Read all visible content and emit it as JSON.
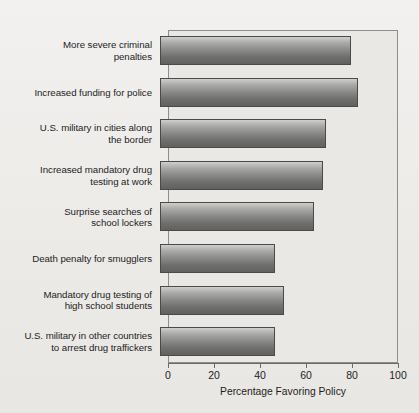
{
  "chart_data": {
    "type": "bar",
    "orientation": "horizontal",
    "title": "",
    "xlabel": "Percentage Favoring Policy",
    "ylabel": "",
    "xlim": [
      0,
      100
    ],
    "xticks": [
      0,
      20,
      40,
      60,
      80,
      100
    ],
    "xtick_labels": [
      "0",
      "20",
      "40",
      "60",
      "80",
      "100"
    ],
    "grid": false,
    "legend": "none",
    "categories": [
      "More severe criminal\npenalties",
      "Increased funding for police",
      "U.S. military in cities along\nthe border",
      "Increased mandatory drug\ntesting at work",
      "Surprise searches of\nschool lockers",
      "Death penalty for smugglers",
      "Mandatory drug testing of\nhigh school students",
      "U.S. military in other countries\nto arrest drug traffickers"
    ],
    "values": [
      83,
      86,
      72,
      71,
      67,
      50,
      54,
      50
    ],
    "colors": {
      "bar_top": "#cfcfcd",
      "bar_bottom": "#616160",
      "bar_border": "#4a4a4a",
      "plot_background": "#e9e8e5",
      "figure_background": "#efeeec",
      "axis": "#6a6a68",
      "text": "#1d1d1d"
    }
  }
}
